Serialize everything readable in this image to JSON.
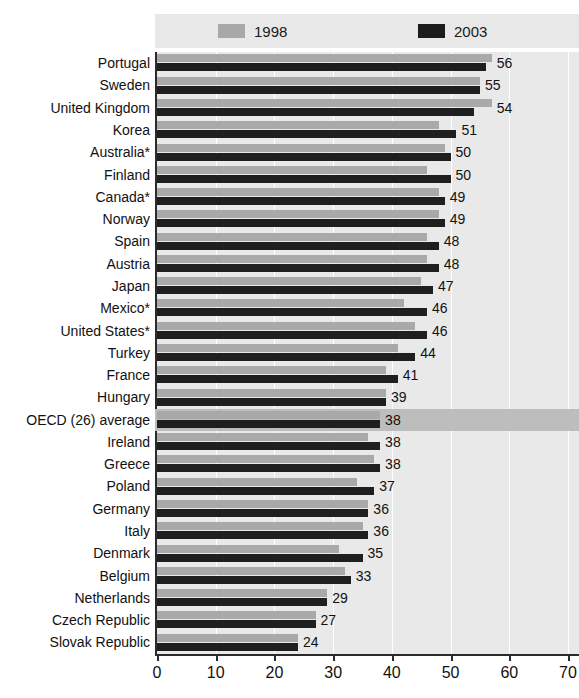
{
  "title_strip": "",
  "legend": {
    "entries": [
      {
        "label": "1998",
        "color": "#a8a8a8",
        "swatch": "legend-swatch-1998"
      },
      {
        "label": "2003",
        "color": "#1c1c1c",
        "swatch": "legend-swatch-2003"
      }
    ]
  },
  "axis": {
    "ticks": [
      "0",
      "10",
      "20",
      "30",
      "40",
      "50",
      "60",
      "70"
    ]
  },
  "chart_data": {
    "type": "bar",
    "orientation": "horizontal",
    "title": "",
    "xlabel": "",
    "ylabel": "",
    "xlim": [
      0,
      70
    ],
    "xticks": [
      0,
      10,
      20,
      30,
      40,
      50,
      60,
      70
    ],
    "grid": true,
    "legend_position": "top",
    "categories": [
      "Portugal",
      "Sweden",
      "United Kingdom",
      "Korea",
      "Australia*",
      "Finland",
      "Canada*",
      "Norway",
      "Spain",
      "Austria",
      "Japan",
      "Mexico*",
      "United States*",
      "Turkey",
      "France",
      "Hungary",
      "OECD (26) average",
      "Ireland",
      "Greece",
      "Poland",
      "Germany",
      "Italy",
      "Denmark",
      "Belgium",
      "Netherlands",
      "Czech Republic",
      "Slovak Republic"
    ],
    "highlight_category": "OECD (26) average",
    "series": [
      {
        "name": "1998",
        "color": "#a9a9a9",
        "values": [
          57,
          55,
          57,
          48,
          49,
          46,
          48,
          48,
          46,
          46,
          45,
          42,
          44,
          41,
          39,
          39,
          38,
          36,
          37,
          34,
          36,
          35,
          31,
          32,
          29,
          27,
          24
        ]
      },
      {
        "name": "2003",
        "color": "#1f1f1f",
        "values": [
          56,
          55,
          54,
          51,
          50,
          50,
          49,
          49,
          48,
          48,
          47,
          46,
          46,
          44,
          41,
          39,
          38,
          38,
          38,
          37,
          36,
          36,
          35,
          33,
          29,
          27,
          24
        ]
      }
    ],
    "value_labels": [
      "56",
      "55",
      "54",
      "51",
      "50",
      "50",
      "49",
      "49",
      "48",
      "48",
      "47",
      "46",
      "46",
      "44",
      "41",
      "39",
      "38",
      "38",
      "38",
      "37",
      "36",
      "36",
      "35",
      "33",
      "29",
      "27",
      "24"
    ]
  }
}
